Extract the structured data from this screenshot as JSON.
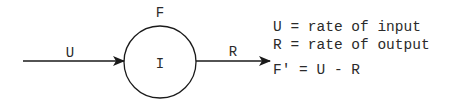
{
  "diagram": {
    "input_label": "U",
    "stock_label_top": "F",
    "stock_label_inside": "I",
    "output_label": "R",
    "colors": {
      "stroke": "#1a1a1a",
      "text": "#2a2a2a",
      "background": "#ffffff"
    }
  },
  "legend": {
    "lines": [
      "U = rate of input",
      "R = rate of output",
      "F′ = U - R"
    ]
  }
}
